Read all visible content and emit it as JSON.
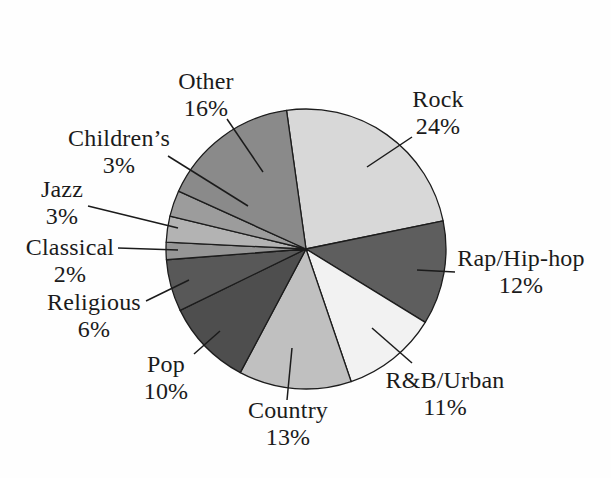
{
  "figure": {
    "background_color": "#fefefe",
    "text_color": "#1b1b1b"
  },
  "chart_data": {
    "type": "pie",
    "title": "",
    "categories": [
      "Rock",
      "Rap/Hip-hop",
      "R&B/Urban",
      "Country",
      "Pop",
      "Religious",
      "Classical",
      "Jazz",
      "Children’s",
      "Other"
    ],
    "values": [
      24,
      12,
      11,
      13,
      10,
      6,
      2,
      3,
      3,
      16
    ],
    "start_angle_deg": -8,
    "direction": "clockwise",
    "stroke_color": "#1c1c1c",
    "legend_position": "none",
    "labels_position": "outside-with-leader-lines",
    "slices": [
      {
        "id": "rock",
        "label": "Rock",
        "pct": "24%",
        "value": 24,
        "color": "#d8d8d8"
      },
      {
        "id": "rap",
        "label": "Rap/Hip-hop",
        "pct": "12%",
        "value": 12,
        "color": "#5e5e5e"
      },
      {
        "id": "rnb",
        "label": "R&B/Urban",
        "pct": "11%",
        "value": 11,
        "color": "#f2f2f2"
      },
      {
        "id": "country",
        "label": "Country",
        "pct": "13%",
        "value": 13,
        "color": "#c0c0c0"
      },
      {
        "id": "pop",
        "label": "Pop",
        "pct": "10%",
        "value": 10,
        "color": "#4e4e4e"
      },
      {
        "id": "religious",
        "label": "Religious",
        "pct": "6%",
        "value": 6,
        "color": "#585858"
      },
      {
        "id": "classical",
        "label": "Classical",
        "pct": "2%",
        "value": 2,
        "color": "#969696"
      },
      {
        "id": "jazz",
        "label": "Jazz",
        "pct": "3%",
        "value": 3,
        "color": "#b3b3b3"
      },
      {
        "id": "childrens",
        "label": "Children’s",
        "pct": "3%",
        "value": 3,
        "color": "#9c9c9c"
      },
      {
        "id": "other",
        "label": "Other",
        "pct": "16%",
        "value": 16,
        "color": "#8a8a8a"
      }
    ]
  }
}
